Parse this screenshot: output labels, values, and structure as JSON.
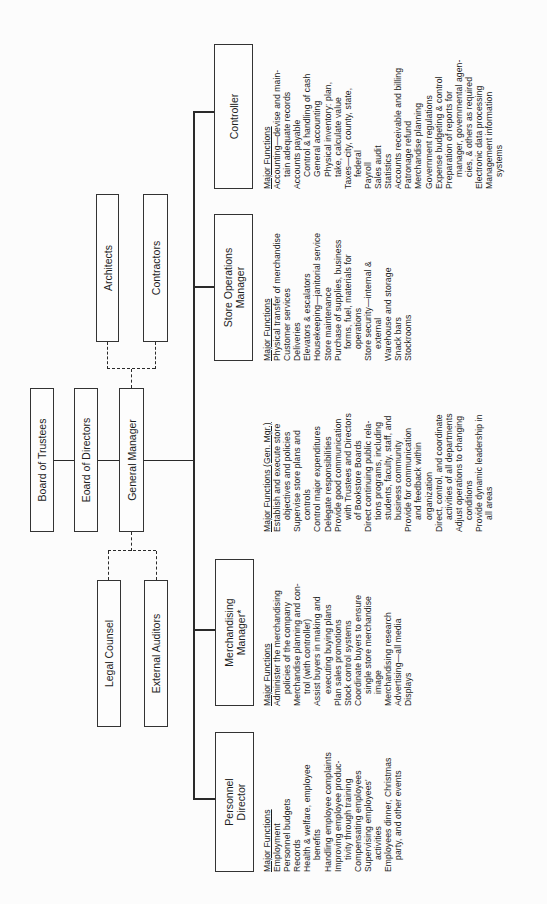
{
  "boxes": {
    "board_trustees": "Board of Trustees",
    "board_directors": "Eoard of Directors",
    "general_manager": "General Manager",
    "architects": "Architects",
    "contractors": "Contractors",
    "legal_counsel": "Legal Counsel",
    "external_auditors": "External Auditors",
    "personnel_director_l1": "Personnel",
    "personnel_director_l2": "Director",
    "merchandising_manager_l1": "Merchandising",
    "merchandising_manager_l2": "Manager*",
    "store_ops_l1": "Store Operations",
    "store_ops_l2": "Manager",
    "controller": "Controller"
  },
  "functions": {
    "personnel": {
      "heading": "Major Functions",
      "items": [
        {
          "text": "Employment",
          "sub": false
        },
        {
          "text": "Personnel budgets",
          "sub": false
        },
        {
          "text": "Records",
          "sub": false
        },
        {
          "text": "Health & welfare, employee",
          "sub": false
        },
        {
          "text": "benefits",
          "sub": true
        },
        {
          "text": "Handling employee complaints",
          "sub": false
        },
        {
          "text": "Improving employee produc-",
          "sub": false
        },
        {
          "text": "tivity through training",
          "sub": true
        },
        {
          "text": "Compensating employees",
          "sub": false
        },
        {
          "text": "Supervising employees'",
          "sub": false
        },
        {
          "text": "activities",
          "sub": true
        },
        {
          "text": "Employees dinner, Christmas",
          "sub": false
        },
        {
          "text": "party, and other events",
          "sub": true
        }
      ]
    },
    "merchandising": {
      "heading": "Major Functions",
      "items": [
        {
          "text": "Administer the merchandising",
          "sub": false
        },
        {
          "text": "policies of the company",
          "sub": true
        },
        {
          "text": "Merchandise planning and con-",
          "sub": false
        },
        {
          "text": "trol (with controller)",
          "sub": true
        },
        {
          "text": "Assist buyers in making and",
          "sub": false
        },
        {
          "text": "executing buying plans",
          "sub": true
        },
        {
          "text": "Plan sales promotions",
          "sub": false
        },
        {
          "text": "Stock control systems",
          "sub": false
        },
        {
          "text": "Coordinate buyers to ensure",
          "sub": false
        },
        {
          "text": "single store merchandise",
          "sub": true
        },
        {
          "text": "image",
          "sub": true
        },
        {
          "text": "Merchandising research",
          "sub": false
        },
        {
          "text": "Advertising—all media",
          "sub": false
        },
        {
          "text": "Displays",
          "sub": false
        }
      ]
    },
    "general_manager": {
      "heading": "Major Functions (Gen. Mgr.)",
      "items": [
        {
          "text": "Establish and execute store",
          "sub": false
        },
        {
          "text": "objectives and policies",
          "sub": true
        },
        {
          "text": "Supervise store plans and",
          "sub": false
        },
        {
          "text": "controls",
          "sub": true
        },
        {
          "text": "Control major expenditures",
          "sub": false
        },
        {
          "text": "Delegate responsibilities",
          "sub": false
        },
        {
          "text": "Provide good communication",
          "sub": false
        },
        {
          "text": "with Trustees and Directors",
          "sub": true
        },
        {
          "text": "of Bookstore Boards",
          "sub": true
        },
        {
          "text": "Direct continuing public rela-",
          "sub": false
        },
        {
          "text": "tions programs, including",
          "sub": true
        },
        {
          "text": "students, faculty, staff, and",
          "sub": true
        },
        {
          "text": "business community",
          "sub": true
        },
        {
          "text": "Provide for communication",
          "sub": false
        },
        {
          "text": "and feedback within",
          "sub": true
        },
        {
          "text": "organization",
          "sub": true
        },
        {
          "text": "Direct, control, and coordinate",
          "sub": false
        },
        {
          "text": "activities of all departments",
          "sub": true
        },
        {
          "text": "Adjust operations to changing",
          "sub": false
        },
        {
          "text": "conditions",
          "sub": true
        },
        {
          "text": "Provide dynamic leadership in",
          "sub": false
        },
        {
          "text": "all areas",
          "sub": true
        }
      ]
    },
    "store_ops": {
      "heading": "Major Functions",
      "items": [
        {
          "text": "Physical transfer of merchandise",
          "sub": false
        },
        {
          "text": "Customer services",
          "sub": false
        },
        {
          "text": "Deliveries",
          "sub": false
        },
        {
          "text": "Elevators & escalators",
          "sub": false
        },
        {
          "text": "Housekeeping—janitorial service",
          "sub": false
        },
        {
          "text": "Store maintenance",
          "sub": false
        },
        {
          "text": "Purchase of supplies, business",
          "sub": false
        },
        {
          "text": "forms, fuel, materials for",
          "sub": true
        },
        {
          "text": "operations",
          "sub": true
        },
        {
          "text": "Store security—internal &",
          "sub": false
        },
        {
          "text": "external",
          "sub": true
        },
        {
          "text": "Warehouse and storage",
          "sub": false
        },
        {
          "text": "Snack bars",
          "sub": false
        },
        {
          "text": "Stockrooms",
          "sub": false
        }
      ]
    },
    "controller": {
      "heading": "Major Functions",
      "items": [
        {
          "text": "Accounting—devise and main-",
          "sub": false
        },
        {
          "text": "tain adequate records",
          "sub": true
        },
        {
          "text": "Accounts payable",
          "sub": false
        },
        {
          "text": "Control & handling of cash",
          "sub": true
        },
        {
          "text": "General accounting",
          "sub": true
        },
        {
          "text": "Physical inventory:  plan,",
          "sub": true
        },
        {
          "text": "take, calculate value",
          "sub": true
        },
        {
          "text": "Taxes—city, county, state,",
          "sub": false
        },
        {
          "text": "federal",
          "sub": true
        },
        {
          "text": "Payroll",
          "sub": false
        },
        {
          "text": "Sales audit",
          "sub": false
        },
        {
          "text": "Statistics",
          "sub": false
        },
        {
          "text": "Accounts receivable and billing",
          "sub": false
        },
        {
          "text": "Patronage refund",
          "sub": false
        },
        {
          "text": "Merchandise planning",
          "sub": false
        },
        {
          "text": "Government regulations",
          "sub": false
        },
        {
          "text": "Expense budgeting & control",
          "sub": false
        },
        {
          "text": "Preparation of reports for",
          "sub": false
        },
        {
          "text": "manager, governmental agen-",
          "sub": true
        },
        {
          "text": "cies, & others as required",
          "sub": true
        },
        {
          "text": "Electronic data processing",
          "sub": false
        },
        {
          "text": "Management information",
          "sub": false
        },
        {
          "text": "systems",
          "sub": true
        }
      ]
    }
  }
}
